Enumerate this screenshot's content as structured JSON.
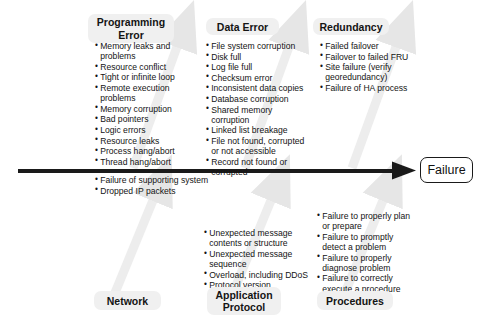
{
  "diagram": {
    "type": "fishbone-ishikawa",
    "effect": "Failure",
    "colors": {
      "spine": "#1a1a1a",
      "bone": "#ededed",
      "chip_background": "#f0f0f0",
      "text": "#141414",
      "page_background": "#ffffff"
    },
    "top_categories": [
      {
        "id": "programming-error",
        "label": "Programming\nError",
        "causes": [
          "Memory leaks and problems",
          "Resource conflict",
          "Tight or infinite loop",
          "Remote execution problems",
          "Memory corruption",
          "Bad pointers",
          "Logic errors",
          "Resource leaks",
          "Process hang/abort",
          "Thread hang/abort"
        ]
      },
      {
        "id": "data-error",
        "label": "Data Error",
        "causes": [
          "File system corruption",
          "Disk full",
          "Log file full",
          "Checksum error",
          "Inconsistent data copies",
          "Database corruption",
          "Shared memory corruption",
          "Linked list breakage",
          "File not found, corrupted or not accessible",
          "Record not found or corrupted"
        ]
      },
      {
        "id": "redundancy",
        "label": "Redundancy",
        "causes": [
          "Failed failover",
          "Failover to failed FRU",
          "Site failure (verify georedundancy)",
          "Failure of HA process"
        ]
      }
    ],
    "bottom_categories": [
      {
        "id": "network",
        "label": "Network",
        "causes": [
          "Failure of supporting system",
          "Dropped IP packets"
        ]
      },
      {
        "id": "application-protocol",
        "label": "Application\nProtocol",
        "causes": [
          "Unexpected message contents or structure",
          "Unexpected message sequence",
          "Overload, including DDoS",
          "Protocol version mismatch"
        ]
      },
      {
        "id": "procedures",
        "label": "Procedures",
        "causes": [
          "Failure to properly plan or prepare",
          "Failure to promptly detect a problem",
          "Failure to properly diagnose problem",
          "Failure to correctly execute a procedure"
        ]
      }
    ]
  }
}
